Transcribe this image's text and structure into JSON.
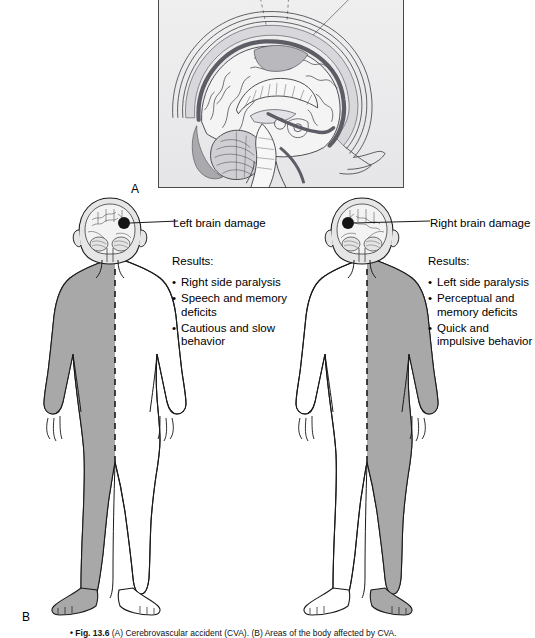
{
  "figure": {
    "number": "Fig. 13.6",
    "caption_bullet": "•",
    "caption_text": "(A) Cerebrovascular accident (CVA). (B) Areas of the body affected by CVA.",
    "panel_a_label": "A",
    "panel_b_label": "B"
  },
  "panel_a": {
    "name": "Cerebrovascular accident (CVA)",
    "description": "Mid-sagittal section of the human head and brain showing cerebrum, corpus callosum, cerebellum, brainstem, meninges and dural venous sinuses",
    "frame_color": "#4a4a4a",
    "background_color": "#ececed"
  },
  "panel_b": {
    "name": "Areas of the body affected by CVA",
    "shade_color": "#a8a8a8",
    "outline_color": "#1a1a1a",
    "lesion_color": "#141414",
    "figures": [
      {
        "id": "left-brain-damage",
        "callout_label": "Left brain damage",
        "lesion_side": "viewer-right",
        "shaded_side": "viewer-left",
        "results_heading": "Results:",
        "results": [
          "Right side paralysis",
          "Speech and memory deficits",
          "Cautious and slow behavior"
        ]
      },
      {
        "id": "right-brain-damage",
        "callout_label": "Right brain damage",
        "lesion_side": "viewer-left",
        "shaded_side": "viewer-right",
        "results_heading": "Results:",
        "results": [
          "Left side paralysis",
          "Perceptual and memory deficits",
          "Quick and impulsive behavior"
        ]
      }
    ]
  }
}
